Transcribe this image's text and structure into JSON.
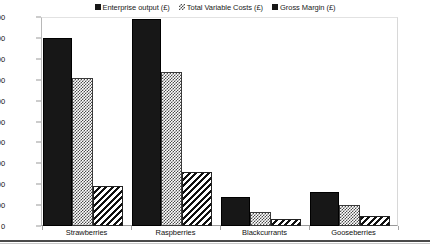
{
  "chart_data": {
    "type": "bar",
    "title": "",
    "subtitle": "",
    "xlabel": "",
    "ylabel": "",
    "ylim": [
      0,
      20000
    ],
    "ytick_step": 2000,
    "ytick_labels": [
      "20,000",
      "18,000",
      "16,000",
      "14,000",
      "12,000",
      "10,000",
      "8,000",
      "6,000",
      "4,000",
      "2,000",
      "0"
    ],
    "ytick_values": [
      20000,
      18000,
      16000,
      14000,
      12000,
      10000,
      8000,
      6000,
      4000,
      2000,
      0
    ],
    "grid": false,
    "legend_position": "top-center",
    "categories": [
      "Strawberries",
      "Raspberries",
      "Blackcurrants",
      "Gooseberries"
    ],
    "series": [
      {
        "name": "Enterprise output (£)",
        "fill": "solid-black",
        "color": "#171717",
        "values": [
          18000,
          19800,
          2800,
          3300
        ]
      },
      {
        "name": "Total Variable Costs (£)",
        "fill": "checkerboard-grey",
        "color": "#4c4c4c",
        "values": [
          14200,
          14700,
          1350,
          2000
        ]
      },
      {
        "name": "Gross Margin (£)",
        "fill": "diagonal-hatch",
        "color": "#101010",
        "values": [
          3800,
          5200,
          700,
          950
        ]
      }
    ]
  }
}
